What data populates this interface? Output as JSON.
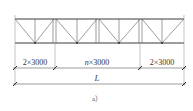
{
  "diagram": {
    "type": "truss-elevation",
    "dimensions": {
      "left_segment": "2×3000",
      "middle_segment_prefix": "n",
      "middle_segment_suffix": "×3000",
      "right_segment": "2×3000",
      "total_label": "L"
    },
    "caption": "a）"
  }
}
